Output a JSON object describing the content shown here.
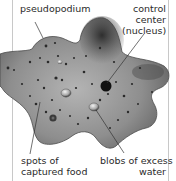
{
  "diagram": {
    "labels": {
      "pseudopodium": "pseudopodium",
      "control_center_line1": "control",
      "control_center_line2": "center",
      "control_center_line3": "(nucleus)",
      "food_line1": "spots of",
      "food_line2": "captured food",
      "water_line1": "blobs of excess",
      "water_line2": "water"
    },
    "colors": {
      "background": "#ffffff",
      "body_fill": "#9a9a9a",
      "body_dark": "#3c3c3c",
      "nucleus": "#111111",
      "leader_line": "#333333",
      "frame": "#c8c8c8"
    }
  }
}
